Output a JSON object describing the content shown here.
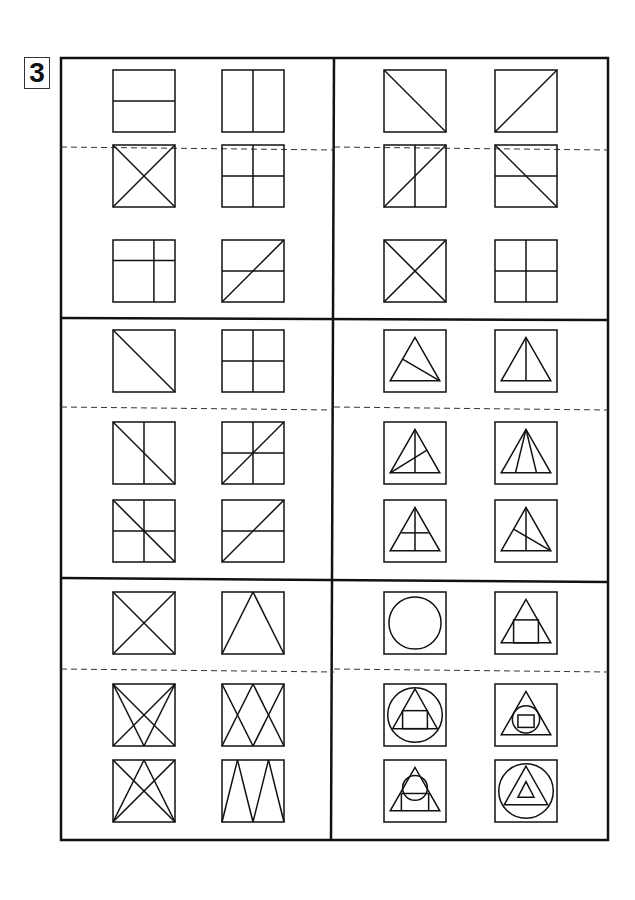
{
  "problem_number": "3",
  "panels": [
    {
      "id": "panel-1",
      "examples": [
        "hline",
        "vline"
      ],
      "choices": [
        [
          "x",
          "cross"
        ],
        [
          "cross_offset",
          "diag_up_hline"
        ]
      ]
    },
    {
      "id": "panel-2",
      "examples": [
        "diag_down",
        "diag_up"
      ],
      "choices": [
        [
          "diag_up_vline",
          "diag_down_hline"
        ],
        [
          "x",
          "cross"
        ]
      ]
    },
    {
      "id": "panel-3",
      "examples": [
        "diag_down",
        "cross"
      ],
      "choices": [
        [
          "diag_down_vline",
          "diag_up_cross"
        ],
        [
          "diag_down_cross",
          "diag_up_hline"
        ]
      ]
    },
    {
      "id": "panel-4",
      "examples": [
        "tri_cevian_left",
        "tri_median"
      ],
      "choices": [
        [
          "tri_median_cevian",
          "tri_three_lines"
        ],
        [
          "tri_median_hline",
          "tri_median_cevian_left"
        ]
      ]
    },
    {
      "id": "panel-5",
      "examples": [
        "x",
        "tri_apex"
      ],
      "choices": [
        [
          "x_double_v",
          "x_w"
        ],
        [
          "x_tri_apex",
          "w_zigzag"
        ]
      ]
    },
    {
      "id": "panel-6",
      "examples": [
        "circle",
        "tri_rect"
      ],
      "choices": [
        [
          "circle_tri_rect",
          "tri_circle_rect"
        ],
        [
          "tri_circle_top",
          "circle_tri_tri"
        ]
      ]
    }
  ]
}
